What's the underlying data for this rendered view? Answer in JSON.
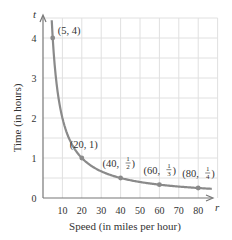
{
  "chart_data": {
    "type": "line",
    "title": "",
    "xlabel": "Speed (in miles per hour)",
    "ylabel": "Time (in hours)",
    "x_axis_var": "r",
    "y_axis_var": "t",
    "xlim": [
      0,
      90
    ],
    "ylim": [
      0,
      4.5
    ],
    "x_ticks": [
      "10",
      "20",
      "30",
      "40",
      "50",
      "60",
      "70",
      "80"
    ],
    "y_ticks": [
      "0",
      "1",
      "2",
      "3",
      "4"
    ],
    "grid": true,
    "curve": "t = 20 / r",
    "series": [
      {
        "name": "t = 20/r",
        "x": [
          4.5,
          5,
          10,
          20,
          30,
          40,
          50,
          60,
          70,
          80,
          87
        ],
        "y": [
          4.44,
          4,
          2,
          1,
          0.667,
          0.5,
          0.4,
          0.333,
          0.286,
          0.25,
          0.23
        ]
      }
    ],
    "labeled_points": [
      {
        "x": 5,
        "y": 4,
        "label": "(5, 4)"
      },
      {
        "x": 20,
        "y": 1,
        "label": "(20, 1)"
      },
      {
        "x": 40,
        "y": 0.5,
        "label_prefix": "(40, ",
        "num": "1",
        "den": "2",
        "label_suffix": ")"
      },
      {
        "x": 60,
        "y": 0.3333,
        "label_prefix": "(60, ",
        "num": "1",
        "den": "3",
        "label_suffix": ")"
      },
      {
        "x": 80,
        "y": 0.25,
        "label_prefix": "(80, ",
        "num": "1",
        "den": "4",
        "label_suffix": ")"
      }
    ],
    "colors": {
      "curve": "#8a8a8a",
      "grid": "#e0e0e0",
      "axis": "#777777"
    }
  }
}
